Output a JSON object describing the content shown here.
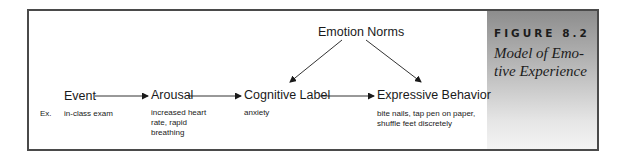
{
  "figure": {
    "number": "FIGURE 8.2",
    "title_lines": [
      "Model of Emo-",
      "tive Experience"
    ]
  },
  "diagram": {
    "top_node": "Emotion Norms",
    "nodes": [
      {
        "label": "Event",
        "example": "in-class exam"
      },
      {
        "label": "Arousal",
        "example": "increased heart rate, rapid breathing"
      },
      {
        "label": "Cognitive Label",
        "example": "anxiety"
      },
      {
        "label": "Expressive Behavior",
        "example": "bite nails, tap pen on paper, shuffle feet discretely"
      }
    ],
    "example_prefix": "Ex.",
    "edges": [
      [
        "Event",
        "Arousal"
      ],
      [
        "Arousal",
        "Cognitive Label"
      ],
      [
        "Cognitive Label",
        "Expressive Behavior"
      ],
      [
        "Emotion Norms",
        "Cognitive Label"
      ],
      [
        "Emotion Norms",
        "Expressive Behavior"
      ]
    ]
  }
}
